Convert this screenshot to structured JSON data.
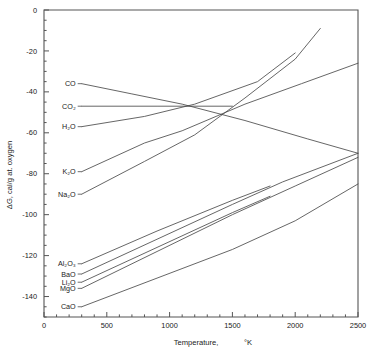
{
  "chart_data": {
    "type": "line",
    "title": "",
    "xlabel": "Temperature,",
    "xlabel_unit": "°K",
    "ylabel": "ΔG,  cal/g at. oxygen",
    "xlim": [
      0,
      2500
    ],
    "ylim": [
      -150,
      0
    ],
    "grid": false,
    "legend": "inline-labels-left",
    "xticks": [
      0,
      500,
      1000,
      1500,
      2000,
      2500
    ],
    "xticklabels": [
      "0",
      "500",
      "1000",
      "1500",
      "2000",
      "2500"
    ],
    "xminor_step": 100,
    "yticks": [
      0,
      -20,
      -40,
      -60,
      -80,
      -100,
      -120,
      -140
    ],
    "yticklabels": [
      "0",
      "-20",
      "-40",
      "-60",
      "-80",
      "-100",
      "-120",
      "-140"
    ],
    "yminor_step": 5,
    "series": [
      {
        "name": "CO",
        "label": "CO",
        "label_x": 300,
        "label_y": -36,
        "points": [
          [
            300,
            -36
          ],
          [
            700,
            -41
          ],
          [
            1100,
            -46
          ],
          [
            1600,
            -54
          ],
          [
            2100,
            -63
          ],
          [
            2500,
            -70
          ]
        ]
      },
      {
        "name": "CO2",
        "label": "CO₂",
        "label_x": 300,
        "label_y": -47,
        "points": [
          [
            300,
            -47
          ],
          [
            900,
            -47
          ],
          [
            1500,
            -47
          ]
        ]
      },
      {
        "name": "H2O",
        "label": "H₂O",
        "label_x": 300,
        "label_y": -57,
        "points": [
          [
            300,
            -57
          ],
          [
            800,
            -52
          ],
          [
            1200,
            -46
          ],
          [
            1700,
            -35
          ],
          [
            2000,
            -21
          ]
        ]
      },
      {
        "name": "K2O",
        "label": "K₂O",
        "label_x": 300,
        "label_y": -79,
        "points": [
          [
            300,
            -79
          ],
          [
            800,
            -65
          ],
          [
            1100,
            -59
          ],
          [
            1600,
            -46
          ],
          [
            2050,
            -36
          ],
          [
            2500,
            -26
          ]
        ]
      },
      {
        "name": "Na2O",
        "label": "Na₂O",
        "label_x": 300,
        "label_y": -90,
        "points": [
          [
            300,
            -90
          ],
          [
            800,
            -74
          ],
          [
            1200,
            -61
          ],
          [
            1600,
            -43
          ],
          [
            2000,
            -24
          ],
          [
            2200,
            -9
          ]
        ]
      },
      {
        "name": "Al2O3",
        "label": "Al₂O₃",
        "label_x": 300,
        "label_y": -124,
        "points": [
          [
            300,
            -124
          ],
          [
            900,
            -108
          ],
          [
            1500,
            -93
          ],
          [
            1800,
            -86
          ]
        ]
      },
      {
        "name": "BaO",
        "label": "BaO",
        "label_x": 300,
        "label_y": -129,
        "points": [
          [
            300,
            -129
          ],
          [
            900,
            -112
          ],
          [
            1500,
            -95
          ],
          [
            1900,
            -84
          ],
          [
            2500,
            -70
          ]
        ]
      },
      {
        "name": "Li2O",
        "label": "Li₂O",
        "label_x": 300,
        "label_y": -133,
        "points": [
          [
            300,
            -133
          ],
          [
            900,
            -116
          ],
          [
            1500,
            -99
          ],
          [
            1800,
            -91
          ]
        ]
      },
      {
        "name": "MgO",
        "label": "MgO",
        "label_x": 300,
        "label_y": -136,
        "points": [
          [
            300,
            -136
          ],
          [
            900,
            -118
          ],
          [
            1500,
            -100
          ],
          [
            2000,
            -86
          ],
          [
            2500,
            -72
          ]
        ]
      },
      {
        "name": "CaO",
        "label": "CaO",
        "label_x": 300,
        "label_y": -145,
        "points": [
          [
            300,
            -145
          ],
          [
            900,
            -131
          ],
          [
            1500,
            -117
          ],
          [
            2000,
            -103
          ],
          [
            2500,
            -85
          ]
        ]
      }
    ]
  },
  "colors": {
    "curve": "#4a4a4a",
    "axis": "#555555",
    "text": "#222222",
    "background": "#ffffff"
  }
}
